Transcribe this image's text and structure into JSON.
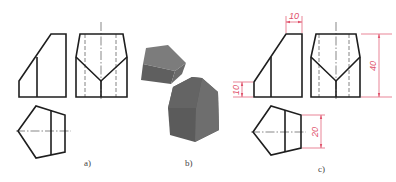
{
  "figure": {
    "panels": [
      {
        "id": "a",
        "label": "a)",
        "description": "Three orthographic views of a truncated pentagonal prism (front, side, top)"
      },
      {
        "id": "b",
        "label": "b)",
        "description": "Shaded 3D renderings of the prism and removed cut piece"
      },
      {
        "id": "c",
        "label": "c)",
        "description": "Three views with dimensions"
      }
    ],
    "dimensions": {
      "top_width": "10",
      "left_height": "10",
      "overall_height": "40",
      "pentagon_side": "20"
    },
    "colors": {
      "object_line": "#1e1e1e",
      "dimension": "#e0506a",
      "solid_light": "#7a7a7a",
      "solid_dark": "#5e5e5e"
    }
  }
}
